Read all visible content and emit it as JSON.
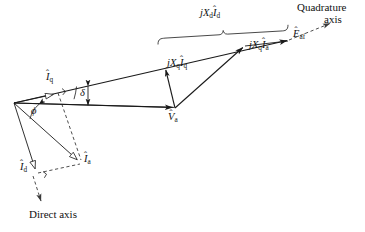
{
  "figure": {
    "type": "phasor-diagram",
    "background_color": "#ffffff",
    "line_color": "#1a1a1a",
    "dashed_color": "#3a3a3a"
  },
  "labels": {
    "e_af": "Êaf",
    "jxd_id": "jXdÎ d",
    "jxq_ia": "jXqÎ a",
    "jxq_iq": "jXqÎ q",
    "v_a": "V̂a",
    "i_q": "Î q",
    "i_d": "Î d",
    "i_a": "Î a",
    "delta": "δ",
    "phi": "ϕ",
    "quadrature_axis_line1": "Quadrature",
    "quadrature_axis_line2": "axis",
    "direct_axis": "Direct axis"
  },
  "label_parts": {
    "e_af": {
      "base": "E",
      "hat": "ˆ",
      "sub": "af"
    },
    "jxd_id": {
      "j": "j",
      "x": "X",
      "xsub": "d",
      "i": "I",
      "hat": "ˆ",
      "isub": "d"
    },
    "jxq_ia": {
      "j": "j",
      "x": "X",
      "xsub": "q",
      "i": "I",
      "hat": "ˆ",
      "isub": "a"
    },
    "jxq_iq": {
      "j": "j",
      "x": "X",
      "xsub": "q",
      "i": "I",
      "hat": "ˆ",
      "isub": "q"
    },
    "v_a": {
      "base": "V",
      "hat": "ˆ",
      "sub": "a"
    },
    "i_q": {
      "base": "I",
      "hat": "ˆ",
      "sub": "q"
    },
    "i_d": {
      "base": "I",
      "hat": "ˆ",
      "sub": "d"
    },
    "i_a": {
      "base": "I",
      "hat": "ˆ",
      "sub": "a"
    }
  },
  "geometry": {
    "origin": {
      "x": 14,
      "y": 103
    },
    "e_af_tip": {
      "x": 290,
      "y": 40
    },
    "quadrature_axis_tip": {
      "x": 333,
      "y": 22
    },
    "v_a_tip": {
      "x": 175,
      "y": 108
    },
    "jxq_iq_tip": {
      "x": 165,
      "y": 67
    },
    "jxq_ia_tip": {
      "x": 245,
      "y": 46
    },
    "i_q_tip": {
      "x": 56,
      "y": 94
    },
    "i_d_tip": {
      "x": 36,
      "y": 172
    },
    "i_a_tip": {
      "x": 80,
      "y": 162
    },
    "direct_axis_tip": {
      "x": 42,
      "y": 205
    },
    "brace_start": {
      "x": 158,
      "y": 42
    },
    "brace_end": {
      "x": 288,
      "y": 33
    }
  },
  "label_positions": {
    "e_af": {
      "x": 293,
      "y": 35
    },
    "jxd_id": {
      "x": 203,
      "y": 14
    },
    "jxq_ia": {
      "x": 250,
      "y": 45
    },
    "jxq_iq": {
      "x": 167,
      "y": 64
    },
    "v_a": {
      "x": 168,
      "y": 113
    },
    "i_q": {
      "x": 47,
      "y": 78
    },
    "i_d": {
      "x": 21,
      "y": 168
    },
    "i_a": {
      "x": 83,
      "y": 159
    },
    "delta": {
      "x": 80,
      "y": 88
    },
    "phi": {
      "x": 31,
      "y": 110
    },
    "quadrature_line1": {
      "x": 298,
      "y": 7
    },
    "quadrature_line2": {
      "x": 325,
      "y": 19
    },
    "direct_axis": {
      "x": 29,
      "y": 211
    }
  }
}
